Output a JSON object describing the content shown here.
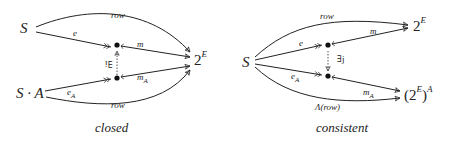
{
  "diagrams": [
    {
      "caption": "closed",
      "objects": {
        "top_left": "S",
        "bottom_left": "S · A",
        "target_base": "2",
        "target_sup": "E"
      },
      "arrows": {
        "row_top": "row",
        "e": "e",
        "m": "m",
        "e_A_base": "e",
        "e_A_sub": "A",
        "m_A_base": "m",
        "m_A_sub": "A",
        "row_bottom": "row",
        "exists": "∃i"
      }
    },
    {
      "caption": "consistent",
      "objects": {
        "source": "S",
        "top_target_base": "2",
        "top_target_sup": "E",
        "bottom_target_base": "(2",
        "bottom_target_sup": "E",
        "bottom_target_close": ")",
        "bottom_target_exp": "A"
      },
      "arrows": {
        "row_top": "row",
        "e": "e",
        "m": "m",
        "e_A_base": "e",
        "e_A_sub": "A",
        "m_A_base": "m",
        "m_A_sub": "A",
        "lambda_row": "Λ(row)",
        "exists": "∃j"
      }
    }
  ]
}
